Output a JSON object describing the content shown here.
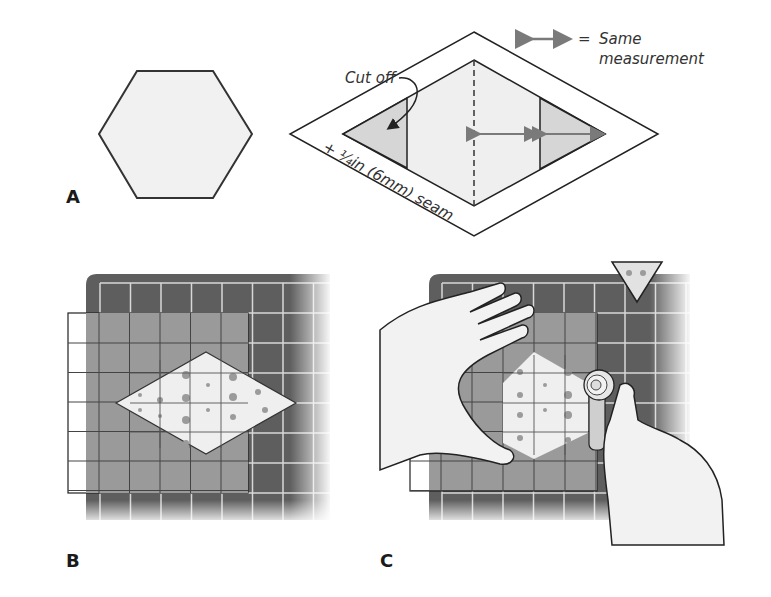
{
  "figure": {
    "panels": [
      {
        "id": "A",
        "label": "A",
        "description": "Hexagon template"
      },
      {
        "id": "B",
        "label": "B",
        "description": "Diamond fabric on ruler over cutting mat"
      },
      {
        "id": "C",
        "label": "C",
        "description": "Trimming diamond to hexagon with rotary cutter"
      }
    ],
    "legend": {
      "symbol": "double-arrow",
      "equals": "=",
      "text_line1": "Same",
      "text_line2": "measurement"
    },
    "annotations": {
      "cut_off": "Cut off",
      "seam": "+ ¼in (6mm) seam"
    },
    "colors": {
      "mat": "#5e5e5e",
      "mat_grid": "#d8d8d8",
      "ruler": "#9a9a9a",
      "fabric": "#efefef",
      "fabric_dots": "#9b9b9b",
      "cutoff_fill": "#d6d6d6",
      "arrow": "#7a7a7a",
      "outline": "#222222",
      "skin": "#f2f2f2"
    }
  }
}
